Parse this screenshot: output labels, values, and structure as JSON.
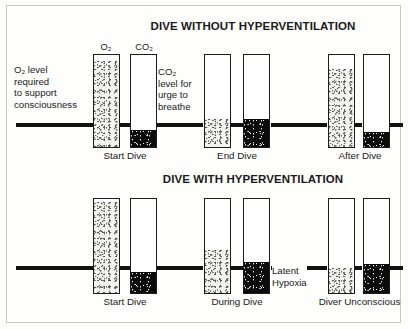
{
  "figure": {
    "width": 408,
    "height": 329,
    "background": "#fdfdfb",
    "border_color": "#c9c9c4",
    "ink_color": "#1a1a1a",
    "o2_fill_color": "#f2f2ef",
    "co2_fill_color": "#0b0b0b"
  },
  "panels": [
    {
      "id": "without-hyperventilation",
      "title": "DIVE WITHOUT HYPERVENTILATION",
      "baseline_label": "O₂ level required to support consciousness",
      "stages": [
        {
          "caption": "Start Dive",
          "bars": [
            {
              "gas": "O₂",
              "header": "O₂",
              "level_pct": 92,
              "above_threshold": true
            },
            {
              "gas": "CO₂",
              "header": "CO₂",
              "level_pct": 18,
              "above_threshold": false
            }
          ]
        },
        {
          "caption": "End Dive",
          "bars": [
            {
              "gas": "O₂",
              "header": "",
              "level_pct": 30,
              "above_threshold": false
            },
            {
              "gas": "CO₂",
              "header": "",
              "level_pct": 30,
              "above_threshold": false
            }
          ]
        },
        {
          "caption": "After Dive",
          "bars": [
            {
              "gas": "O₂",
              "header": "",
              "level_pct": 84,
              "above_threshold": true
            },
            {
              "gas": "CO₂",
              "header": "",
              "level_pct": 16,
              "above_threshold": false
            }
          ]
        }
      ]
    },
    {
      "id": "with-hyperventilation",
      "title": "DIVE WITH HYPERVENTILATION",
      "stages": [
        {
          "caption": "Start Dive",
          "bars": [
            {
              "gas": "O₂",
              "header": "",
              "level_pct": 95,
              "above_threshold": true
            },
            {
              "gas": "CO₂",
              "header": "",
              "level_pct": 22,
              "above_threshold": false
            }
          ]
        },
        {
          "caption": "During Dive",
          "bars": [
            {
              "gas": "O₂",
              "header": "",
              "level_pct": 45,
              "above_threshold": true
            },
            {
              "gas": "CO₂",
              "header": "",
              "level_pct": 32,
              "above_threshold": false
            }
          ]
        },
        {
          "caption": "Diver Unconscious",
          "bars": [
            {
              "gas": "O₂",
              "header": "",
              "level_pct": 26,
              "above_threshold": false
            },
            {
              "gas": "CO₂",
              "header": "",
              "level_pct": 30,
              "above_threshold": false
            }
          ]
        }
      ]
    }
  ],
  "annotations": {
    "o2_threshold": {
      "lines": [
        "O₂ level",
        "required",
        "to support",
        "consciousness"
      ],
      "line1": "O₂ level",
      "line2": "required",
      "line3": "to support",
      "line4": "consciousness"
    },
    "co2_threshold": {
      "lines": [
        "CO₂",
        "level for",
        "urge to",
        "breathe"
      ],
      "line1": "CO₂",
      "line2": "level for",
      "line3": "urge to",
      "line4": "breathe"
    },
    "latent_hypoxia": {
      "line1": "Latent",
      "line2": "Hypoxia"
    }
  },
  "headers": {
    "o2": "O₂",
    "co2": "CO₂"
  },
  "captions": {
    "top_start": "Start Dive",
    "top_end": "End Dive",
    "top_after": "After Dive",
    "bottom_start": "Start Dive",
    "bottom_during": "During Dive",
    "bottom_unconscious": "Diver Unconscious"
  },
  "titles": {
    "top": "DIVE WITHOUT HYPERVENTILATION",
    "bottom": "DIVE WITH HYPERVENTILATION"
  }
}
